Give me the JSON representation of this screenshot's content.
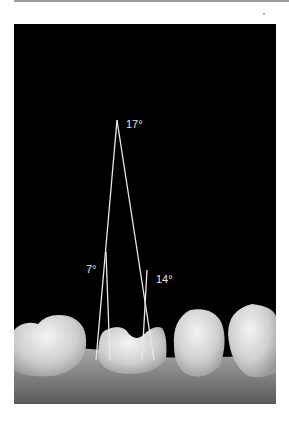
{
  "figure": {
    "angles": [
      {
        "label": "17°",
        "value": 17,
        "position": "apex"
      },
      {
        "label": "7°",
        "value": 7,
        "position": "left"
      },
      {
        "label": "14°",
        "value": 14,
        "position": "right"
      }
    ]
  },
  "colors": {
    "background": "#000000",
    "lines": "#e8e8e8",
    "teeth": "#d8d8d8",
    "gum": "#8a8a8a"
  }
}
